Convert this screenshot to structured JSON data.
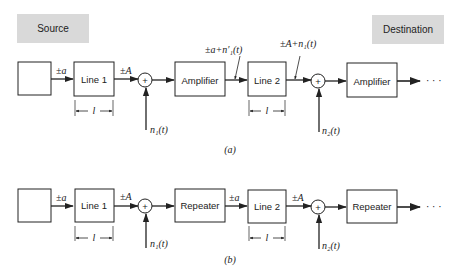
{
  "labels": {
    "source": "Source",
    "destination": "Destination"
  },
  "diagram_a": {
    "caption": "(a)",
    "input_signal": "±a",
    "line1": "Line 1",
    "line1_out": "±A",
    "adder1_symbol": "+",
    "noise1": "n₁(t)",
    "stage1": "Amplifier",
    "stage1_out": "±a+n′₁(t)",
    "line2": "Line 2",
    "line2_out": "±A+n₁(t)",
    "adder2_symbol": "+",
    "noise2": "n₂(t)",
    "stage2": "Amplifier",
    "length1": "l",
    "length2": "l",
    "ellipsis": "· · ·"
  },
  "diagram_b": {
    "caption": "(b)",
    "input_signal": "±a",
    "line1": "Line 1",
    "line1_out": "±A",
    "adder1_symbol": "+",
    "noise1": "n₁(t)",
    "stage1": "Repeater",
    "stage1_out": "±a",
    "line2": "Line 2",
    "line2_out": "±A",
    "adder2_symbol": "+",
    "noise2": "n₂(t)",
    "stage2": "Repeater",
    "length1": "l",
    "length2": "l",
    "ellipsis": "· · ·"
  }
}
